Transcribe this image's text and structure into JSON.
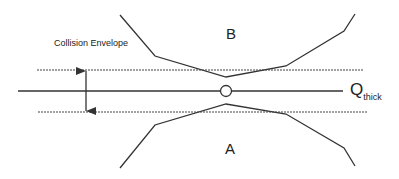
{
  "labels": {
    "envelope": "Collision Envelope",
    "region_b": "B",
    "region_a": "A",
    "q_main": "Q",
    "q_sub": "thick"
  },
  "colors": {
    "line": "#333333",
    "background": "#ffffff"
  },
  "geometry": {
    "boundary_b": [
      [
        120,
        15
      ],
      [
        155,
        56
      ],
      [
        226,
        77
      ],
      [
        286,
        66
      ],
      [
        344,
        31
      ],
      [
        355,
        14
      ]
    ],
    "boundary_a": [
      [
        120,
        168
      ],
      [
        155,
        125
      ],
      [
        226,
        104
      ],
      [
        286,
        114
      ],
      [
        344,
        148
      ],
      [
        355,
        166
      ]
    ],
    "envelope_top_y": 70,
    "envelope_bottom_y": 112,
    "center_line_y": 91,
    "configuration_point": [
      226,
      91
    ]
  }
}
